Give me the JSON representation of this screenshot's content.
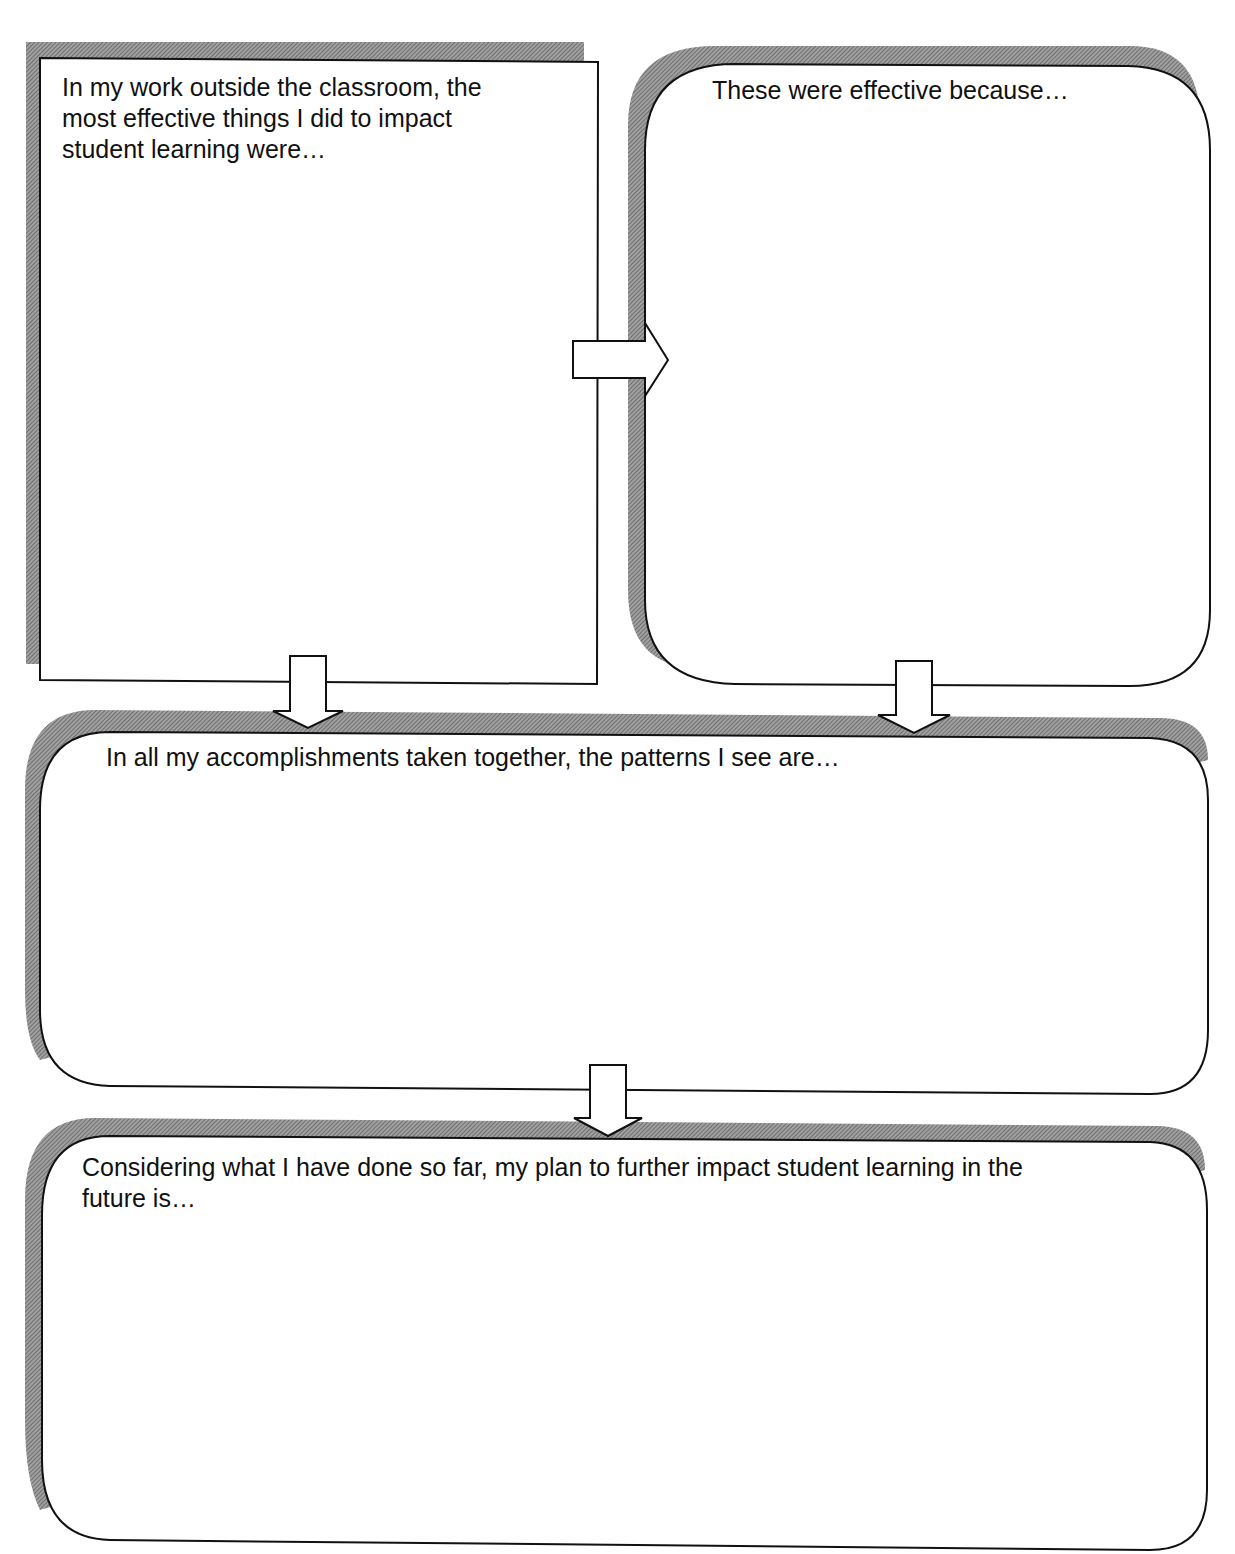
{
  "worksheet": {
    "boxes": [
      {
        "id": "box1",
        "prompt": "In my work outside the classroom, the\nmost effective things I did to impact\nstudent learning were…"
      },
      {
        "id": "box2",
        "prompt": "These were effective because…"
      },
      {
        "id": "box3",
        "prompt": "In all my accomplishments taken together, the patterns I see are…"
      },
      {
        "id": "box4",
        "prompt": "Considering what I have done so far, my plan to further impact student learning in the\nfuture is…"
      }
    ],
    "arrows": [
      {
        "from": "box1",
        "to": "box2",
        "direction": "right"
      },
      {
        "from": "box1",
        "to": "box3",
        "direction": "down"
      },
      {
        "from": "box2",
        "to": "box3",
        "direction": "down"
      },
      {
        "from": "box3",
        "to": "box4",
        "direction": "down"
      }
    ],
    "colors": {
      "stroke": "#111111",
      "shadow": "#8a8a8a",
      "fill": "#ffffff"
    }
  }
}
